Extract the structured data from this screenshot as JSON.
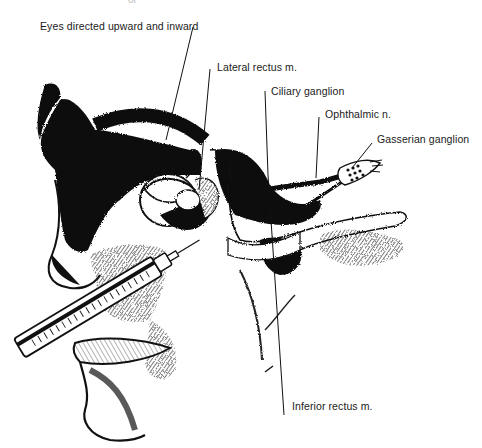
{
  "figure": {
    "top_fragment": "or",
    "labels": [
      {
        "id": "eyes-directed",
        "text": "Eyes directed upward and inward",
        "x": 40,
        "y": 20
      },
      {
        "id": "lateral-rectus",
        "text": "Lateral rectus m.",
        "x": 217,
        "y": 64
      },
      {
        "id": "ciliary-ganglion",
        "text": "Ciliary ganglion",
        "x": 271,
        "y": 87
      },
      {
        "id": "ophthalmic-n",
        "text": "Ophthalmic n.",
        "x": 325,
        "y": 110
      },
      {
        "id": "gasserian-ganglion",
        "text": "Gasserian ganglion",
        "x": 377,
        "y": 134
      },
      {
        "id": "inferior-rectus",
        "text": "Inferior rectus m.",
        "x": 292,
        "y": 402
      }
    ],
    "colors": {
      "ink": "#111111",
      "background": "#ffffff",
      "label_text": "#1a1a1a"
    }
  }
}
